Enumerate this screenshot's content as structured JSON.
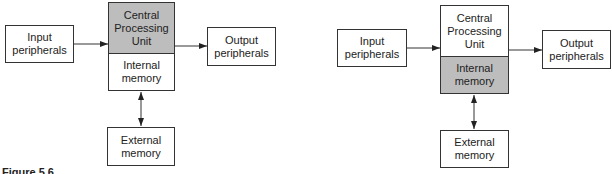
{
  "diagrams": [
    {
      "input": "Input\nperipherals",
      "cpu": "Central\nProcessing\nUnit",
      "internal": "Internal\nmemory",
      "output": "Output\nperipherals",
      "external": "External\nmemory",
      "highlighted": "cpu"
    },
    {
      "input": "Input\nperipherals",
      "cpu": "Central\nProcessing\nUnit",
      "internal": "Internal\nmemory",
      "output": "Output\nperipherals",
      "external": "External\nmemory",
      "highlighted": "internal"
    }
  ],
  "caption": "Figure 5.6",
  "colors": {
    "shade": "#bdbdbd",
    "line": "#333333"
  }
}
